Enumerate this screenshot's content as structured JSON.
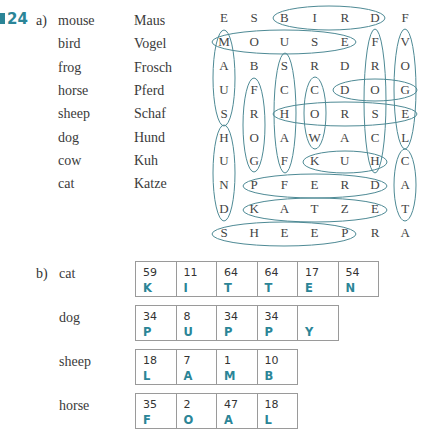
{
  "exercise": {
    "number": "24",
    "part_a_label": "a)",
    "part_b_label": "b)",
    "accent_color": "#2b8597"
  },
  "word_list": [
    {
      "en": "mouse",
      "de": "Maus"
    },
    {
      "en": "bird",
      "de": "Vogel"
    },
    {
      "en": "frog",
      "de": "Frosch"
    },
    {
      "en": "horse",
      "de": "Pferd"
    },
    {
      "en": "sheep",
      "de": "Schaf"
    },
    {
      "en": "dog",
      "de": "Hund"
    },
    {
      "en": "cow",
      "de": "Kuh"
    },
    {
      "en": "cat",
      "de": "Katze"
    }
  ],
  "grid": [
    [
      "E",
      "S",
      "B",
      "I",
      "R",
      "D",
      "F"
    ],
    [
      "M",
      "O",
      "U",
      "S",
      "E",
      "F",
      "V"
    ],
    [
      "A",
      "B",
      "S",
      "R",
      "D",
      "R",
      "O"
    ],
    [
      "U",
      "F",
      "C",
      "C",
      "D",
      "O",
      "G"
    ],
    [
      "S",
      "R",
      "H",
      "O",
      "R",
      "S",
      "E"
    ],
    [
      "H",
      "O",
      "A",
      "W",
      "A",
      "C",
      "L"
    ],
    [
      "U",
      "G",
      "F",
      "K",
      "U",
      "H",
      "C"
    ],
    [
      "N",
      "P",
      "F",
      "E",
      "R",
      "D",
      "A"
    ],
    [
      "D",
      "K",
      "A",
      "T",
      "Z",
      "E",
      "T"
    ],
    [
      "S",
      "H",
      "E",
      "E",
      "P",
      "R",
      "A"
    ]
  ],
  "found_words": [
    "BIRD",
    "MOUSE",
    "MAUS",
    "FROSCH",
    "VOGEL",
    "SCHAF",
    "FROG",
    "COW",
    "DOG",
    "HORSE",
    "HUND",
    "KUH",
    "CAT",
    "PFERD",
    "KATZE",
    "SHEEP"
  ],
  "codes": [
    {
      "animal": "cat",
      "cells": [
        {
          "n": "59",
          "l": "K"
        },
        {
          "n": "11",
          "l": "I"
        },
        {
          "n": "64",
          "l": "T"
        },
        {
          "n": "64",
          "l": "T"
        },
        {
          "n": "17",
          "l": "E"
        },
        {
          "n": "54",
          "l": "N"
        }
      ]
    },
    {
      "animal": "dog",
      "cells": [
        {
          "n": "34",
          "l": "P"
        },
        {
          "n": "8",
          "l": "U"
        },
        {
          "n": "34",
          "l": "P"
        },
        {
          "n": "34",
          "l": "P"
        },
        {
          "n": "",
          "l": "Y"
        }
      ]
    },
    {
      "animal": "sheep",
      "cells": [
        {
          "n": "18",
          "l": "L"
        },
        {
          "n": "7",
          "l": "A"
        },
        {
          "n": "1",
          "l": "M"
        },
        {
          "n": "10",
          "l": "B"
        }
      ]
    },
    {
      "animal": "horse",
      "cells": [
        {
          "n": "35",
          "l": "F"
        },
        {
          "n": "2",
          "l": "O"
        },
        {
          "n": "47",
          "l": "A"
        },
        {
          "n": "18",
          "l": "L"
        }
      ]
    }
  ]
}
